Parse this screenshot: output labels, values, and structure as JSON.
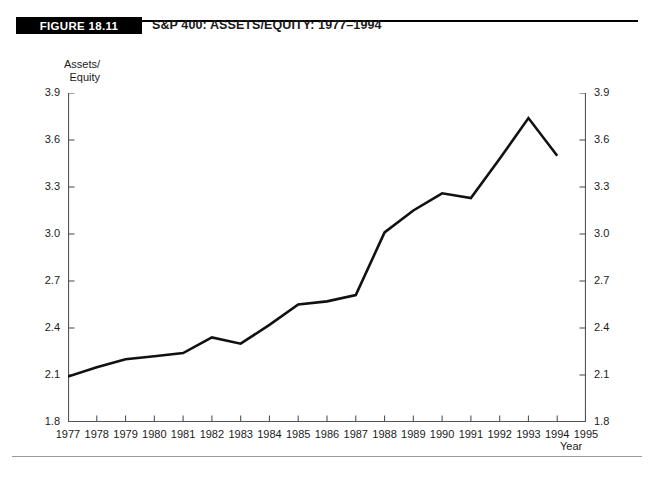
{
  "figure": {
    "tag": "FIGURE 18.11",
    "title": "S&P 400: ASSETS/EQUITY: 1977–1994"
  },
  "axes": {
    "y_title": "Assets/\nEquity",
    "x_title": "Year",
    "y_ticks": [
      "1.8",
      "2.1",
      "2.4",
      "2.7",
      "3.0",
      "3.3",
      "3.6",
      "3.9"
    ],
    "x_ticks": [
      "1977",
      "1978",
      "1979",
      "1980",
      "1981",
      "1982",
      "1983",
      "1984",
      "1985",
      "1986",
      "1987",
      "1988",
      "1989",
      "1990",
      "1991",
      "1992",
      "1993",
      "1994",
      "1995"
    ]
  },
  "style": {
    "line_color": "#111111",
    "axis_color": "#555555",
    "tag_background": "#000000",
    "tag_text_color": "#ffffff"
  },
  "chart_data": {
    "type": "line",
    "title": "S&P 400: ASSETS/EQUITY: 1977–1994",
    "xlabel": "Year",
    "ylabel": "Assets/Equity",
    "xlim": [
      1977,
      1995
    ],
    "ylim": [
      1.8,
      3.9
    ],
    "grid": false,
    "legend": null,
    "x": [
      1977,
      1978,
      1979,
      1980,
      1981,
      1982,
      1983,
      1984,
      1985,
      1986,
      1987,
      1988,
      1989,
      1990,
      1991,
      1992,
      1993,
      1994
    ],
    "values": [
      2.09,
      2.15,
      2.2,
      2.22,
      2.24,
      2.34,
      2.3,
      2.42,
      2.55,
      2.57,
      2.61,
      3.01,
      3.15,
      3.26,
      3.23,
      3.48,
      3.74,
      3.5
    ],
    "series": [
      {
        "name": "Assets/Equity",
        "values": [
          2.09,
          2.15,
          2.2,
          2.22,
          2.24,
          2.34,
          2.3,
          2.42,
          2.55,
          2.57,
          2.61,
          3.01,
          3.15,
          3.26,
          3.23,
          3.48,
          3.74,
          3.5
        ]
      }
    ]
  }
}
